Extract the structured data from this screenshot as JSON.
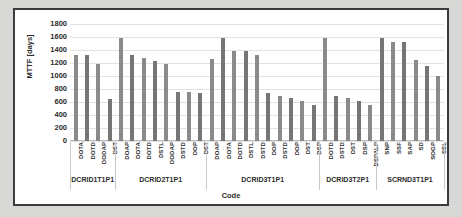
{
  "chart_data": {
    "type": "bar",
    "title": "",
    "xlabel": "Code",
    "ylabel": "MTTF [days]",
    "ylim": [
      0,
      1800
    ],
    "ytick_step": 200,
    "yticks": [
      1800,
      1600,
      1400,
      1200,
      1000,
      800,
      600,
      400,
      200,
      0
    ],
    "grid": true,
    "legend": "none",
    "bar_color": "#808080",
    "categories": [
      "DOTA",
      "DOTD",
      "DODAP",
      "DST",
      "DOAP",
      "DOTA",
      "DOTD",
      "DSTL",
      "DODAP",
      "DSTD",
      "DOP",
      "DST",
      "DOAP",
      "DOTA",
      "DOTD",
      "DSTL",
      "DSTD",
      "DOP",
      "DSTD",
      "DOP",
      "DST",
      "DSP",
      "DOTD",
      "DSTD",
      "DST",
      "DSP",
      "DSPALP",
      "SNP",
      "SSF",
      "SAP",
      "SD",
      "SOGP",
      "SSL"
    ],
    "values": [
      1320,
      1320,
      1180,
      650,
      1580,
      1330,
      1280,
      1230,
      1180,
      760,
      760,
      740,
      1260,
      1580,
      1390,
      1390,
      1330,
      740,
      700,
      660,
      620,
      560,
      1580,
      700,
      660,
      620,
      560,
      1580,
      1520,
      1520,
      1250,
      1160,
      1000
    ],
    "groups": [
      {
        "label": "DCRID1T1P1",
        "count": 4
      },
      {
        "label": "DCRID2T1P1",
        "count": 8
      },
      {
        "label": "DCRID3T1P1",
        "count": 10
      },
      {
        "label": "DCRID3T2P1",
        "count": 5
      },
      {
        "label": "SCRND3T1P1",
        "count": 6
      }
    ]
  }
}
